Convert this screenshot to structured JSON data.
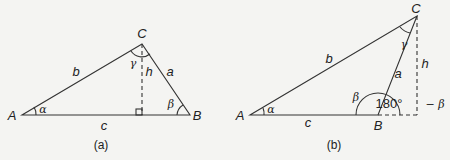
{
  "figure_a": {
    "caption": "(a)",
    "vertices": {
      "A": "A",
      "B": "B",
      "C": "C"
    },
    "sides": {
      "a": "a",
      "b": "b",
      "c": "c",
      "h": "h"
    },
    "angles": {
      "alpha": "α",
      "beta": "β",
      "gamma": "γ"
    }
  },
  "figure_b": {
    "caption": "(b)",
    "vertices": {
      "A": "A",
      "B": "B",
      "C": "C"
    },
    "sides": {
      "a": "a",
      "b": "b",
      "c": "c",
      "h": "h"
    },
    "angles": {
      "alpha": "α",
      "beta": "β",
      "gamma": "γ",
      "beta_exterior_num": "180°",
      "beta_exterior_minus": "− β"
    }
  }
}
